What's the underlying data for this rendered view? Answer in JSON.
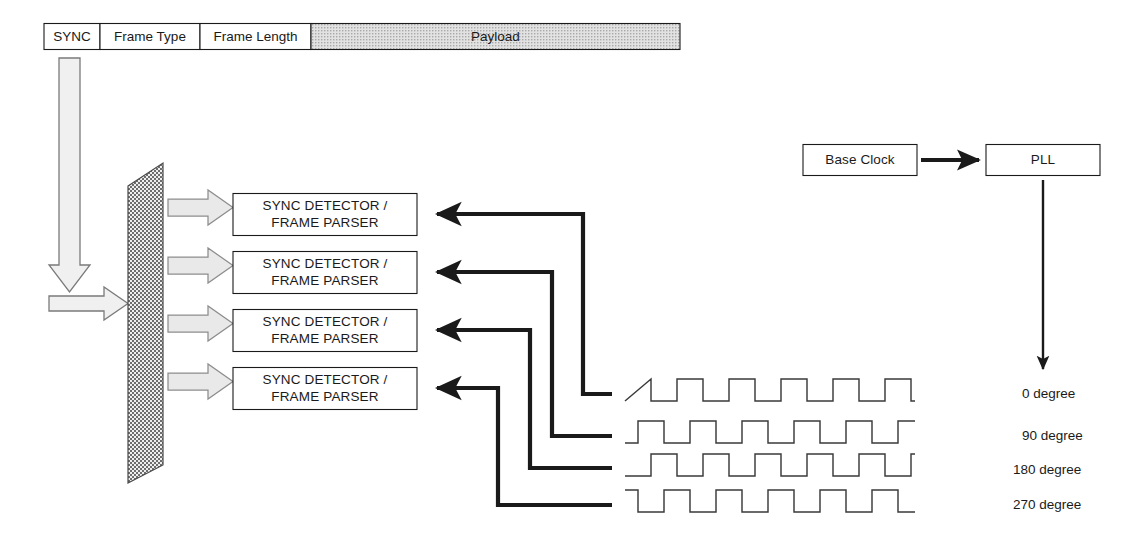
{
  "diagram": {
    "colors": {
      "stroke": "#1a1a1a",
      "wave_stroke": "#333333",
      "block_arrow_fill": "#ececec",
      "block_arrow_stroke": "#808080",
      "splitter_fill": "#b0b0b0",
      "payload_fill": "#d0d0d0",
      "white": "#ffffff"
    },
    "frame_header": {
      "name": "frame-format-bar",
      "cells": [
        {
          "label": "SYNC",
          "shaded": false
        },
        {
          "label": "Frame Type",
          "shaded": false
        },
        {
          "label": "Frame Length",
          "shaded": false
        },
        {
          "label": "Payload",
          "shaded": true
        }
      ]
    },
    "splitter": {
      "name": "signal-splitter",
      "label": ""
    },
    "detectors": [
      {
        "line1": "SYNC DETECTOR /",
        "line2": "FRAME PARSER"
      },
      {
        "line1": "SYNC DETECTOR /",
        "line2": "FRAME PARSER"
      },
      {
        "line1": "SYNC DETECTOR /",
        "line2": "FRAME PARSER"
      },
      {
        "line1": "SYNC DETECTOR /",
        "line2": "FRAME PARSER"
      }
    ],
    "clock_chain": {
      "base_clock": "Base Clock",
      "pll": "PLL"
    },
    "phases": [
      {
        "label": "0 degree",
        "phase_deg": 0
      },
      {
        "label": "90 degree",
        "phase_deg": 90
      },
      {
        "label": "180 degree",
        "phase_deg": 180
      },
      {
        "label": "270 degree",
        "phase_deg": 270
      }
    ],
    "waveform": {
      "type": "square",
      "cycles": 5,
      "period_px": 52,
      "amplitude_px": 22,
      "duty": 0.5
    }
  }
}
